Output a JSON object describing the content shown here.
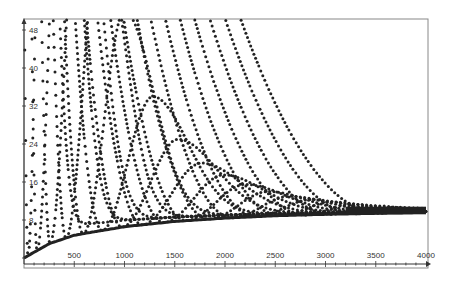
{
  "chart_data": {
    "type": "scatter",
    "title": "",
    "xlabel": "",
    "ylabel": "",
    "xlim": [
      0,
      4000
    ],
    "ylim": [
      0,
      50
    ],
    "grid": false,
    "legend": "none",
    "x_ticks": [
      500,
      1000,
      1500,
      2000,
      2500,
      3000,
      3500,
      4000
    ],
    "x_tick_labels": [
      "500",
      "1000",
      "1500",
      "2000",
      "2500",
      "3000",
      "3500",
      "4000"
    ],
    "y_ticks": [
      0,
      8,
      16,
      24,
      32,
      40,
      48
    ],
    "y_tick_labels": [
      "0",
      "8",
      "16",
      "24",
      "32",
      "40",
      "48"
    ],
    "x_minor_tick_step": 100,
    "asymptote": 10,
    "lower_envelope": {
      "x": [
        0,
        250,
        500,
        1000,
        1500,
        2000,
        2500,
        3000,
        3500,
        4000
      ],
      "y": [
        0,
        3.0,
        4.8,
        6.6,
        7.7,
        8.4,
        8.9,
        9.2,
        9.4,
        9.6
      ]
    },
    "series": [
      {
        "name": "curve-1",
        "contact_x": 40,
        "peak_x": 200,
        "peak_y": 120
      },
      {
        "name": "curve-2",
        "contact_x": 130,
        "peak_x": 380,
        "peak_y": 100
      },
      {
        "name": "curve-3",
        "contact_x": 260,
        "peak_x": 560,
        "peak_y": 85
      },
      {
        "name": "curve-4",
        "contact_x": 420,
        "peak_x": 760,
        "peak_y": 70
      },
      {
        "name": "curve-5",
        "contact_x": 590,
        "peak_x": 1000,
        "peak_y": 52
      },
      {
        "name": "curve-6",
        "contact_x": 780,
        "peak_x": 1280,
        "peak_y": 34
      },
      {
        "name": "curve-7",
        "contact_x": 980,
        "peak_x": 1530,
        "peak_y": 25
      },
      {
        "name": "curve-8",
        "contact_x": 1180,
        "peak_x": 1760,
        "peak_y": 20
      },
      {
        "name": "curve-9",
        "contact_x": 1400,
        "peak_x": 1980,
        "peak_y": 17.5
      },
      {
        "name": "curve-10",
        "contact_x": 1620,
        "peak_x": 2200,
        "peak_y": 15.5
      },
      {
        "name": "curve-11",
        "contact_x": 1850,
        "peak_x": 2420,
        "peak_y": 14
      },
      {
        "name": "curve-12",
        "contact_x": 2080,
        "peak_x": 2640,
        "peak_y": 13
      },
      {
        "name": "curve-13",
        "contact_x": 2320,
        "peak_x": 2850,
        "peak_y": 12.3
      },
      {
        "name": "curve-14",
        "contact_x": 2560,
        "peak_x": 3060,
        "peak_y": 11.8
      },
      {
        "name": "curve-15",
        "contact_x": 2800,
        "peak_x": 3270,
        "peak_y": 11.3
      },
      {
        "name": "curve-16",
        "contact_x": 3050,
        "peak_x": 3480,
        "peak_y": 11.0
      },
      {
        "name": "curve-17",
        "contact_x": 3300,
        "peak_x": 3690,
        "peak_y": 10.7
      },
      {
        "name": "curve-18",
        "contact_x": 3550,
        "peak_x": 3900,
        "peak_y": 10.5
      }
    ],
    "marker": {
      "shape": "circle",
      "color": "#222222"
    },
    "frame": {
      "color": "#888888"
    }
  }
}
